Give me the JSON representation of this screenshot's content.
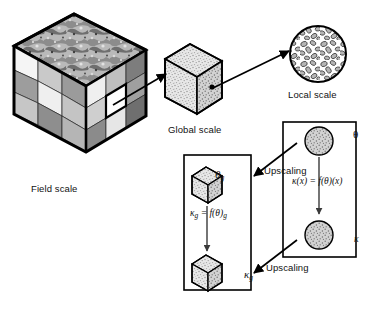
{
  "figure": {
    "type": "multi-scale-upscaling-diagram",
    "title": "",
    "labels": {
      "field_scale": "Field scale",
      "global_scale": "Global scale",
      "local_scale": "Local scale",
      "upscaling_top": "Upscaling",
      "upscaling_bottom": "Upscaling"
    },
    "symbols": {
      "theta": "θ",
      "kappa": "κ",
      "theta_g_base": "θ",
      "theta_g_sub": "g",
      "kappa_g_base": "κ",
      "kappa_g_sub": "g"
    },
    "equations": {
      "left_box": {
        "lhs_base": "κ",
        "lhs_sub": "g",
        "eq": " = ",
        "rhs": "f(θ)",
        "rhs_sub": "g",
        "full": "κ_g = f(θ)_g"
      },
      "right_box": {
        "full": "κ(x) = f(θ)(x)"
      }
    },
    "nodes": [
      {
        "name": "field-scale-cube",
        "label": "Field scale",
        "style": "3x3-checkerboard-cube-with-terrain-top"
      },
      {
        "name": "global-scale-cube",
        "label": "Global scale",
        "style": "speckled-cube-with-point"
      },
      {
        "name": "local-scale-circle",
        "label": "Local scale",
        "style": "grain-packed-circle"
      },
      {
        "name": "theta-g-cube",
        "label": "θg",
        "style": "speckled-cube"
      },
      {
        "name": "kappa-g-cube",
        "label": "κg",
        "style": "speckled-cube"
      },
      {
        "name": "theta-circle",
        "label": "θ",
        "style": "speckled-circle"
      },
      {
        "name": "kappa-circle",
        "label": "κ",
        "style": "speckled-circle"
      }
    ],
    "arrows": [
      {
        "name": "arrow-field-to-global",
        "from": "field-scale-cube",
        "to": "global-scale-cube"
      },
      {
        "name": "arrow-global-to-local",
        "from": "global-scale-cube",
        "to": "local-scale-circle"
      },
      {
        "name": "arrow-theta-to-kappa-left",
        "from": "theta-g-cube",
        "to": "kappa-g-cube"
      },
      {
        "name": "arrow-theta-to-kappa-right",
        "from": "theta-circle",
        "to": "kappa-circle"
      },
      {
        "name": "arrow-upscaling-top",
        "from": "theta-circle",
        "to": "theta-g-cube",
        "label": "Upscaling"
      },
      {
        "name": "arrow-upscaling-bottom",
        "from": "kappa-circle",
        "to": "kappa-g-cube",
        "label": "Upscaling"
      }
    ],
    "colors": {
      "stroke": "#000000",
      "background": "#ffffff",
      "cube_light": "#f2f2f2",
      "cube_mid": "#c8c8c8",
      "cube_dark": "#8a8a8a",
      "speckle": "#d9d9d9"
    }
  }
}
